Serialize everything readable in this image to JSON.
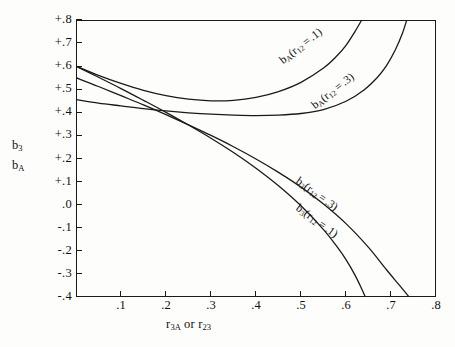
{
  "figure": {
    "background_color": "#fdfdfb",
    "ink_color": "#1a1a1a"
  },
  "axes": {
    "y_title_line1": "b3",
    "y_title_line2": "bA",
    "x_title": "r3A or r23",
    "y_ticks": [
      "+.8",
      "+.7",
      "+.6",
      "+.5",
      "+.4",
      "+.3",
      "+.2",
      "+.1",
      ".0",
      "-.1",
      "-.2",
      "-.3",
      "-.4"
    ],
    "x_ticks": [
      ".1",
      ".2",
      ".3",
      ".4",
      ".5",
      ".6",
      ".7",
      ".8"
    ]
  },
  "curve_labels": {
    "ba_r12_01": "bA(r12 = .1)",
    "ba_r12_03": "bA(r12 = .3)",
    "b3_r12_03": "b3(r12 = .3)",
    "b3_r12_01": "b3(r12 = .1)"
  },
  "chart_data": {
    "type": "line",
    "title": "",
    "xlabel": "r3A or r23",
    "ylabel": "b3 / bA",
    "xlim": [
      0.0,
      0.8
    ],
    "ylim": [
      -0.4,
      0.8
    ],
    "grid": false,
    "legend": "inline-curve-labels",
    "x_ticks": [
      0.1,
      0.2,
      0.3,
      0.4,
      0.5,
      0.6,
      0.7,
      0.8
    ],
    "y_ticks": [
      -0.4,
      -0.3,
      -0.2,
      -0.1,
      0.0,
      0.1,
      0.2,
      0.3,
      0.4,
      0.5,
      0.6,
      0.7,
      0.8
    ],
    "series": [
      {
        "name": "bA(r12 = .1)",
        "color": "#1a1a1a",
        "points": [
          [
            0.0,
            0.6
          ],
          [
            0.05,
            0.56
          ],
          [
            0.1,
            0.525
          ],
          [
            0.15,
            0.495
          ],
          [
            0.2,
            0.472
          ],
          [
            0.25,
            0.457
          ],
          [
            0.3,
            0.45
          ],
          [
            0.35,
            0.452
          ],
          [
            0.4,
            0.465
          ],
          [
            0.45,
            0.49
          ],
          [
            0.5,
            0.53
          ],
          [
            0.55,
            0.592
          ],
          [
            0.58,
            0.645
          ],
          [
            0.6,
            0.69
          ],
          [
            0.62,
            0.75
          ],
          [
            0.635,
            0.8
          ]
        ]
      },
      {
        "name": "bA(r12 = .3)",
        "color": "#1a1a1a",
        "points": [
          [
            0.0,
            0.455
          ],
          [
            0.05,
            0.44
          ],
          [
            0.1,
            0.428
          ],
          [
            0.15,
            0.416
          ],
          [
            0.2,
            0.406
          ],
          [
            0.25,
            0.398
          ],
          [
            0.3,
            0.392
          ],
          [
            0.35,
            0.388
          ],
          [
            0.4,
            0.386
          ],
          [
            0.45,
            0.388
          ],
          [
            0.5,
            0.395
          ],
          [
            0.55,
            0.412
          ],
          [
            0.6,
            0.448
          ],
          [
            0.64,
            0.497
          ],
          [
            0.67,
            0.552
          ],
          [
            0.69,
            0.602
          ],
          [
            0.71,
            0.672
          ],
          [
            0.725,
            0.74
          ],
          [
            0.735,
            0.8
          ]
        ]
      },
      {
        "name": "b3(r12 = .3)",
        "color": "#1a1a1a",
        "points": [
          [
            0.0,
            0.6
          ],
          [
            0.05,
            0.552
          ],
          [
            0.1,
            0.503
          ],
          [
            0.15,
            0.452
          ],
          [
            0.2,
            0.4
          ],
          [
            0.25,
            0.345
          ],
          [
            0.3,
            0.288
          ],
          [
            0.35,
            0.226
          ],
          [
            0.4,
            0.158
          ],
          [
            0.45,
            0.082
          ],
          [
            0.5,
            -0.005
          ],
          [
            0.55,
            -0.108
          ],
          [
            0.58,
            -0.182
          ],
          [
            0.6,
            -0.238
          ],
          [
            0.62,
            -0.305
          ],
          [
            0.635,
            -0.365
          ],
          [
            0.643,
            -0.4
          ]
        ]
      },
      {
        "name": "b3(r12 = .1)",
        "color": "#1a1a1a",
        "points": [
          [
            0.0,
            0.55
          ],
          [
            0.05,
            0.512
          ],
          [
            0.1,
            0.472
          ],
          [
            0.15,
            0.432
          ],
          [
            0.2,
            0.39
          ],
          [
            0.25,
            0.346
          ],
          [
            0.3,
            0.3
          ],
          [
            0.35,
            0.251
          ],
          [
            0.4,
            0.198
          ],
          [
            0.45,
            0.14
          ],
          [
            0.5,
            0.076
          ],
          [
            0.55,
            0.003
          ],
          [
            0.6,
            -0.082
          ],
          [
            0.65,
            -0.185
          ],
          [
            0.69,
            -0.282
          ],
          [
            0.72,
            -0.352
          ],
          [
            0.74,
            -0.4
          ]
        ]
      }
    ]
  }
}
